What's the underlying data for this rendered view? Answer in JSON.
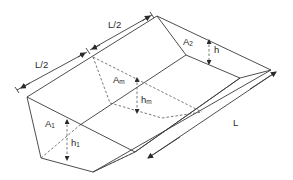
{
  "diagram": {
    "labels": {
      "half_length_1": "L/2",
      "half_length_2": "L/2",
      "length": "L",
      "area_end_2": {
        "base": "A",
        "sub": "2"
      },
      "depth_end_2": "h",
      "area_mid": {
        "base": "A",
        "sub": "m"
      },
      "depth_mid": {
        "base": "h",
        "sub": "m"
      },
      "area_end_1": {
        "base": "A",
        "sub": "1"
      },
      "depth_end_1": {
        "base": "h",
        "sub": "1"
      }
    },
    "colors": {
      "line": "#3a3a3a",
      "background": "#ffffff"
    }
  }
}
